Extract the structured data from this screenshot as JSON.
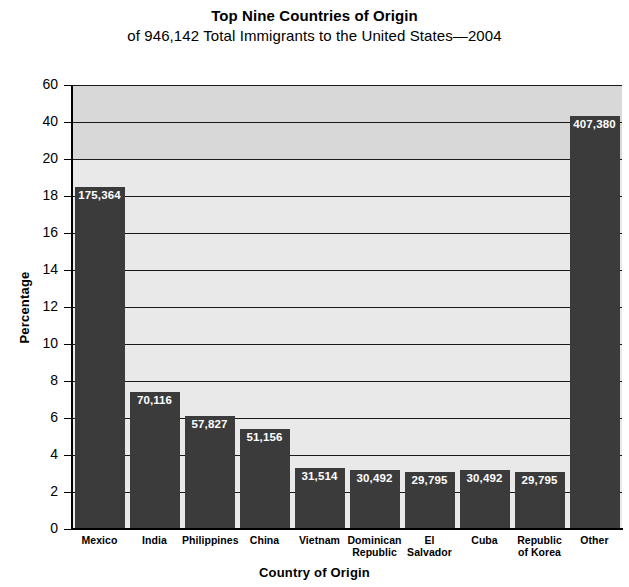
{
  "chart_data": {
    "type": "bar",
    "title": "Top Nine Countries of Origin",
    "subtitle": "of 946,142 Total Immigrants to the United States—2004",
    "xlabel": "Country of Origin",
    "ylabel": "Percentage",
    "grid": true,
    "legend": "none",
    "total_immigrants": 946142,
    "year": 2004,
    "axis_note": "broken y-axis: linear 0-20 by 2, then 20-40-60",
    "ylim": [
      0,
      60
    ],
    "yticks": [
      0,
      2,
      4,
      6,
      8,
      10,
      12,
      14,
      16,
      18,
      20,
      40,
      60
    ],
    "ytick_labels": [
      "0",
      "2",
      "4",
      "6",
      "8",
      "10",
      "12",
      "14",
      "16",
      "18",
      "20",
      "40",
      "60"
    ],
    "categories": [
      "Mexico",
      "India",
      "Philippines",
      "China",
      "Vietnam",
      "Dominican Republic",
      "El Salvador",
      "Cuba",
      "Republic of Korea",
      "Other"
    ],
    "category_labels": [
      [
        "Mexico"
      ],
      [
        "India"
      ],
      [
        "Philippines"
      ],
      [
        "China"
      ],
      [
        "Vietnam"
      ],
      [
        "Dominican",
        "Republic"
      ],
      [
        "El Salvador"
      ],
      [
        "Cuba"
      ],
      [
        "Republic",
        "of Korea"
      ],
      [
        "Other"
      ]
    ],
    "data_labels": [
      "175,364",
      "70,116",
      "57,827",
      "51,156",
      "31,514",
      "30,492",
      "29,795",
      "30,492",
      "29,795",
      "407,380"
    ],
    "counts": [
      175364,
      70116,
      57827,
      51156,
      31514,
      30492,
      29795,
      30492,
      29795,
      407380
    ],
    "values": [
      18.5,
      7.4,
      6.1,
      5.4,
      3.3,
      3.2,
      3.1,
      3.2,
      3.1,
      43.1
    ]
  },
  "colors": {
    "bar": "#3b3b3b",
    "plot_background_lower": "#e9e9e9",
    "plot_background_upper": "#d8d8d8",
    "gridline": "#1a1a1a",
    "axis": "#000000",
    "data_label_text": "#ffffff"
  }
}
